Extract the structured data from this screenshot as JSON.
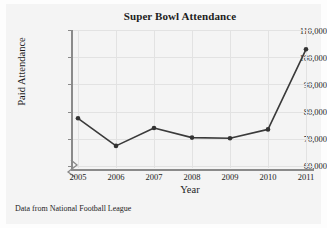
{
  "figure": {
    "title": "Super Bowl Attendance",
    "source_note": "Data from National Football League",
    "line_color": "#3a3a3a",
    "marker_color": "#333333",
    "axis_color": "#8a8a8a",
    "grid_color": "#e2e2e2",
    "background": "#f4f4f4"
  },
  "chart_data": {
    "type": "line",
    "title": "Super Bowl Attendance",
    "xlabel": "Year",
    "ylabel": "Paid Attendance",
    "x": [
      2005,
      2006,
      2007,
      2008,
      2009,
      2010,
      2011
    ],
    "categories": [
      "2005",
      "2006",
      "2007",
      "2008",
      "2009",
      "2010",
      "2011"
    ],
    "values": [
      78000,
      68000,
      74500,
      71000,
      70800,
      74000,
      103000
    ],
    "series": [
      {
        "name": "Paid Attendance",
        "values": [
          78000,
          68000,
          74500,
          71000,
          70800,
          74000,
          103000
        ]
      }
    ],
    "xlim": [
      2005,
      2011
    ],
    "ylim": [
      60000,
      110000
    ],
    "ytick_labels": [
      "60,000",
      "70,000",
      "80,000",
      "90,000",
      "100,000",
      "110,000"
    ],
    "yticks": [
      60000,
      70000,
      80000,
      90000,
      100000,
      110000
    ],
    "xtick_labels": [
      "2005",
      "2006",
      "2007",
      "2008",
      "2009",
      "2010",
      "2011"
    ],
    "grid": true,
    "legend": "none",
    "axis_break": true,
    "markers": "filled-circle",
    "annotations": [
      "Data from National Football League"
    ]
  }
}
